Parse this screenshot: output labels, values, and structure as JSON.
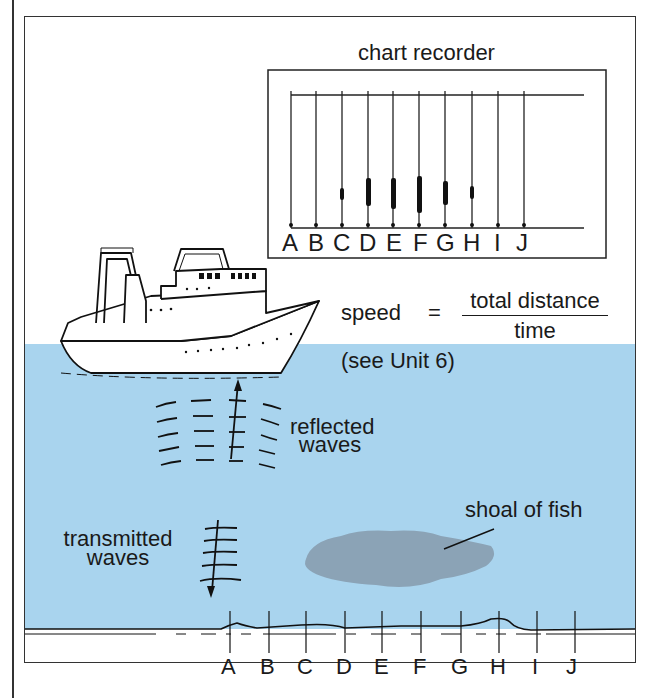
{
  "diagram": {
    "type": "echo-sounder",
    "colors": {
      "water": "#a9d4ee",
      "shoal": "#8ba3b6",
      "line": "#1a1a1a",
      "background": "#ffffff"
    },
    "chart_recorder": {
      "title": "chart recorder",
      "columns": [
        "A",
        "B",
        "C",
        "D",
        "E",
        "F",
        "G",
        "H",
        "I",
        "J"
      ],
      "marks": {
        "A": false,
        "B": false,
        "C": true,
        "D": true,
        "E": true,
        "F": true,
        "G": true,
        "H": true,
        "I": false,
        "J": false
      }
    },
    "formula": {
      "lhs": "speed",
      "equals": "=",
      "numerator": "total distance",
      "denominator": "time"
    },
    "reference": "(see Unit 6)",
    "labels": {
      "reflected_line1": "reflected",
      "reflected_line2": "waves",
      "transmitted_line1": "transmitted",
      "transmitted_line2": "waves",
      "shoal": "shoal of fish"
    },
    "seabed_positions": [
      "A",
      "B",
      "C",
      "D",
      "E",
      "F",
      "G",
      "H",
      "I",
      "J"
    ]
  }
}
